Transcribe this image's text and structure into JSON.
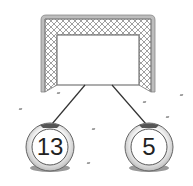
{
  "diagram": {
    "type": "number-bond",
    "goal": {
      "label": "",
      "value": ""
    },
    "balls": [
      {
        "position": "left",
        "value": "13"
      },
      {
        "position": "right",
        "value": "5"
      }
    ]
  }
}
